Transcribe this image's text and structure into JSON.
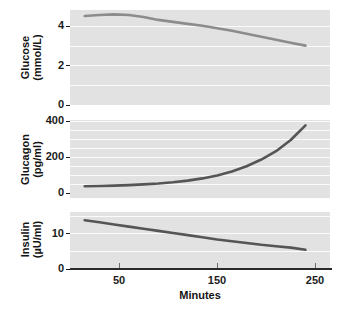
{
  "chart_data": [
    {
      "type": "line",
      "panel": "glucose",
      "title": "",
      "ylabel_line1": "Glucose",
      "ylabel_line2": "(mmol/L)",
      "xlabel": "Minutes",
      "ylim": [
        0,
        4.8
      ],
      "xlim": [
        0,
        265
      ],
      "yticks": [
        0,
        2,
        4
      ],
      "ytick_labels": [
        "0",
        "2",
        "4"
      ],
      "gridlines": [
        1,
        2,
        3,
        4
      ],
      "grid": true,
      "line_color": "#8c8c8c",
      "x": [
        15,
        30,
        45,
        60,
        75,
        90,
        105,
        120,
        135,
        150,
        165,
        180,
        195,
        210,
        225,
        240
      ],
      "values": [
        4.5,
        4.55,
        4.58,
        4.55,
        4.45,
        4.3,
        4.2,
        4.1,
        4.0,
        3.88,
        3.75,
        3.6,
        3.45,
        3.3,
        3.15,
        3.0
      ]
    },
    {
      "type": "line",
      "panel": "glucagon",
      "title": "",
      "ylabel_line1": "Glucagon",
      "ylabel_line2": "(pg/ml)",
      "xlabel": "Minutes",
      "ylim": [
        0,
        430
      ],
      "xlim": [
        0,
        265
      ],
      "yticks": [
        0,
        200,
        400
      ],
      "ytick_labels": [
        "0",
        "200",
        "400"
      ],
      "gridlines": [
        50,
        100,
        150,
        200,
        250,
        300,
        350,
        400
      ],
      "grid": true,
      "line_color": "#555555",
      "x": [
        15,
        30,
        45,
        60,
        75,
        90,
        105,
        120,
        135,
        150,
        165,
        180,
        195,
        210,
        225,
        240
      ],
      "values": [
        65,
        66,
        68,
        71,
        75,
        80,
        87,
        96,
        108,
        124,
        146,
        175,
        212,
        258,
        320,
        400
      ]
    },
    {
      "type": "line",
      "panel": "insulin",
      "title": "",
      "ylabel_line1": "Insulin",
      "ylabel_line2": "(µU/ml)",
      "xlabel": "Minutes",
      "ylim": [
        0,
        16
      ],
      "xlim": [
        0,
        265
      ],
      "yticks": [
        0,
        10
      ],
      "ytick_labels": [
        "0",
        "10"
      ],
      "gridlines": [
        5,
        10,
        15
      ],
      "grid": true,
      "line_color": "#555555",
      "x": [
        15,
        30,
        45,
        60,
        75,
        90,
        105,
        120,
        135,
        150,
        165,
        180,
        195,
        210,
        225,
        240
      ],
      "values": [
        13.7,
        13.1,
        12.5,
        11.9,
        11.3,
        10.7,
        10.1,
        9.5,
        8.9,
        8.3,
        7.8,
        7.3,
        6.8,
        6.4,
        6.0,
        5.4
      ]
    }
  ],
  "xaxis": {
    "title": "Minutes",
    "ticks": [
      50,
      150,
      250
    ],
    "tick_labels": [
      "50",
      "150",
      "250"
    ]
  },
  "style": {
    "panel_background": "#e2e2e2",
    "gridline_color": "#fbfbfb",
    "axis_color": "#2b2b2b",
    "text_color": "#141414",
    "page_background": "#ffffff"
  }
}
